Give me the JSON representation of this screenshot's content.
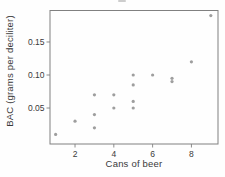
{
  "figure": {
    "background": "#fefefe",
    "cropped_fragment": "partial glyph cut off at top edge of screenshot"
  },
  "chart_data": {
    "type": "scatter",
    "xlabel": "Cans of beer",
    "ylabel": "BAC (grams per deciliter)",
    "points": [
      [
        1,
        0.01
      ],
      [
        2,
        0.03
      ],
      [
        3,
        0.02
      ],
      [
        3,
        0.04
      ],
      [
        3,
        0.07
      ],
      [
        4,
        0.05
      ],
      [
        4,
        0.07
      ],
      [
        5,
        0.05
      ],
      [
        5,
        0.06
      ],
      [
        5,
        0.085
      ],
      [
        5,
        0.1
      ],
      [
        6,
        0.1
      ],
      [
        7,
        0.09
      ],
      [
        7,
        0.095
      ],
      [
        8,
        0.12
      ],
      [
        9,
        0.19
      ]
    ],
    "xticks": [
      2,
      4,
      6,
      8
    ],
    "xtick_labels": [
      "2",
      "4",
      "6",
      "8"
    ],
    "yticks": [
      0.05,
      0.1,
      0.15
    ],
    "ytick_labels": [
      "0.05",
      "0.10",
      "0.15"
    ],
    "xlim": [
      0.71,
      9.37
    ],
    "ylim": [
      -0.0045,
      0.1977
    ],
    "grid": false,
    "legend": false,
    "point_color": "#949494",
    "point_radius": 1.6,
    "frame_color": "#808080",
    "tick_color": "#808080",
    "text_color": "#3a3a3a",
    "tick_font_size": 8.5
  }
}
